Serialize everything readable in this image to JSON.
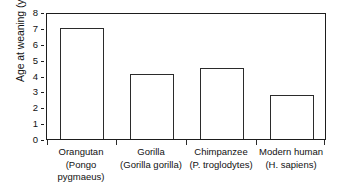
{
  "chart_data": {
    "type": "bar",
    "title": "",
    "subtitle": "",
    "xlabel": "",
    "ylabel": "Age at weaning (years)",
    "ylim": [
      0,
      8
    ],
    "yticks": [
      0,
      1,
      2,
      3,
      4,
      5,
      6,
      7,
      8
    ],
    "ytick_labels": [
      "0",
      "1",
      "2",
      "3",
      "4",
      "5",
      "6",
      "7",
      "8"
    ],
    "grid": false,
    "legend": null,
    "legend_position": "none",
    "categories": [
      "Orangutan (Pongo pygmaeus)",
      "Gorilla (Gorilla gorilla)",
      "Chimpanzee (P. troglodytes)",
      "Modern human (H. sapiens)"
    ],
    "category_common_names": [
      "Orangutan",
      "Gorilla",
      "Chimpanzee",
      "Modern human"
    ],
    "category_scientific_names": [
      "(Pongo pygmaeus)",
      "(Gorilla gorilla)",
      "(P. troglodytes)",
      "(H. sapiens)"
    ],
    "values": [
      7.0,
      4.1,
      4.5,
      2.8
    ],
    "bar_color": "#ffffff",
    "bar_edge_color": "#2b2b2b",
    "axis_color": "#1d1d1d",
    "text_color": "#111111"
  }
}
